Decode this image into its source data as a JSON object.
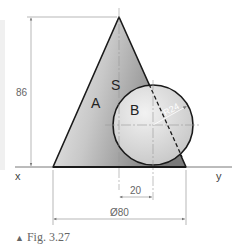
{
  "figure": {
    "caption_marker": "▲",
    "caption": "Fig. 3.27",
    "labels": {
      "cone": "A",
      "sphere": "B",
      "contact": "S",
      "x_axis": "x",
      "y_axis": "y"
    },
    "dimensions": {
      "height": "86",
      "offset": "20",
      "base_diameter": "Ø80",
      "sphere_radius": "R24"
    },
    "colors": {
      "outline": "#1a1a1a",
      "cone_fill_light": "#f2f2f2",
      "cone_fill_dark": "#8c8c8c",
      "sphere_fill": "#dcdcdc",
      "dimension_line": "#888888"
    }
  }
}
